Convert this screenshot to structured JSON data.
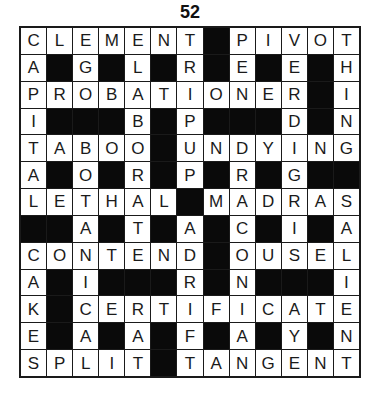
{
  "puzzle": {
    "number": "52",
    "rows": 13,
    "cols": 13,
    "colors": {
      "cell": "#ffffff",
      "block": "#0a0a0a",
      "line": "#1a1a1a"
    },
    "grid": [
      "CLEMENT#PIVOT",
      "A#G#L#R#E#E#H",
      "PROBATIONER#I",
      "I###B#P###D#N",
      "TABOO#UNDYING",
      "A#O#R#P#R#G##",
      "LETHAL#MADRAS",
      "##A#T#A#C#I#A",
      "CONTEND#OUSEL",
      "A#I###R#N###I",
      "K#CERTIFICATE",
      "E#A#A#F#A#Y#N",
      "SPLIT#TANGENT"
    ],
    "answers": {
      "across": [
        "CLEMENT",
        "PIVOT",
        "PROBATIONER",
        "TABOO",
        "UNDYING",
        "LETHAL",
        "MADRAS",
        "CONTEND",
        "OUSEL",
        "CERTIFICATE",
        "SPLIT",
        "TANGENT"
      ],
      "down": [
        "CAPITAL",
        "EGOTAIL",
        "ELABORATE",
        "TRIPUP",
        "PENDING",
        "VERDIGRIS",
        "THING",
        "BOTANICAL",
        "ADRIFT",
        "MACRONAVAL",
        "ALEN",
        "SALIENT",
        "CAKES"
      ]
    }
  }
}
